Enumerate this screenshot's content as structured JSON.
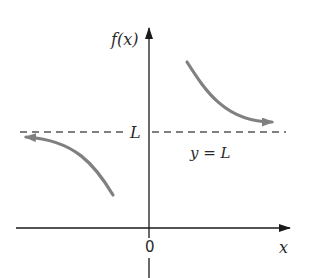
{
  "figure": {
    "type": "horizontal-asymptote-diagram",
    "labels": {
      "y_axis": "f(x)",
      "x_axis": "x",
      "origin": "0",
      "asymptote_value": "L",
      "asymptote_equation": "y = L"
    },
    "colors": {
      "axes": "#1a1a1a",
      "curve": "#808080",
      "asymptote": "#555555",
      "text": "#2a2a2a"
    },
    "curves": [
      {
        "name": "left-branch",
        "description": "approaches L from below as x → -∞",
        "arrow": "left"
      },
      {
        "name": "right-branch",
        "description": "approaches L from above as x → +∞",
        "arrow": "right"
      }
    ]
  }
}
